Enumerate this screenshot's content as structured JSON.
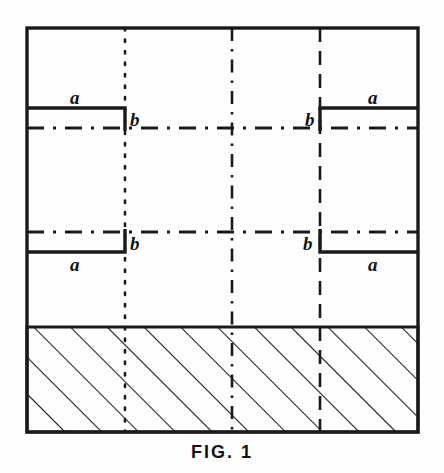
{
  "figure": {
    "caption": "FIG. 1",
    "labels": {
      "upper_left_surface": "a",
      "upper_left_step": "b",
      "upper_right_step": "b",
      "upper_right_surface": "a",
      "lower_left_surface": "a",
      "lower_left_step": "b",
      "lower_right_step": "b",
      "lower_right_surface": "a"
    },
    "colors": {
      "ink": "#1a1a1a",
      "paper": "#fefefe"
    },
    "geometry": {
      "frame": {
        "x": 27,
        "y": 28,
        "width": 391,
        "height": 404
      },
      "hatched_block": {
        "x": 27,
        "y": 327,
        "width": 391,
        "height": 105
      },
      "step_x_left": 125,
      "step_x_right": 320,
      "upper_datum_y": 128,
      "lower_datum_y": 232,
      "upper_surface_y": 108,
      "lower_surface_y": 252
    },
    "line_styles": {
      "frame": "solid",
      "profile": "solid",
      "datum_horizontal": "dash-dot",
      "vertical_left": "dotted",
      "vertical_center": "dash-dot",
      "vertical_right": "dashed",
      "hatching": "solid-45-degree"
    }
  }
}
